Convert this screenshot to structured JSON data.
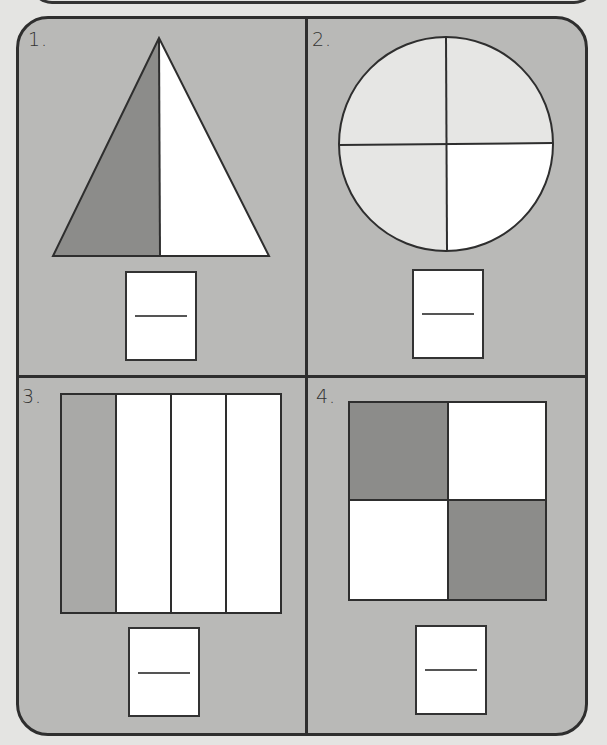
{
  "worksheet": {
    "problems": [
      {
        "number": "1.",
        "shape": "triangle",
        "parts": 2,
        "shaded_parts": 1,
        "answer_numerator": "",
        "answer_denominator": ""
      },
      {
        "number": "2.",
        "shape": "circle",
        "parts": 4,
        "shaded_parts": 3,
        "answer_numerator": "",
        "answer_denominator": ""
      },
      {
        "number": "3.",
        "shape": "rectangle",
        "parts": 4,
        "shaded_parts": 1,
        "answer_numerator": "",
        "answer_denominator": ""
      },
      {
        "number": "4.",
        "shape": "square",
        "parts": 4,
        "shaded_parts": 2,
        "answer_numerator": "",
        "answer_denominator": ""
      }
    ]
  },
  "colors": {
    "page_background": "#e4e4e2",
    "panel_background": "#b9b9b7",
    "dark_shade": "#8c8c8a",
    "light_shade": "#e6e6e4",
    "white": "#ffffff",
    "stroke": "#2e2e2e"
  }
}
